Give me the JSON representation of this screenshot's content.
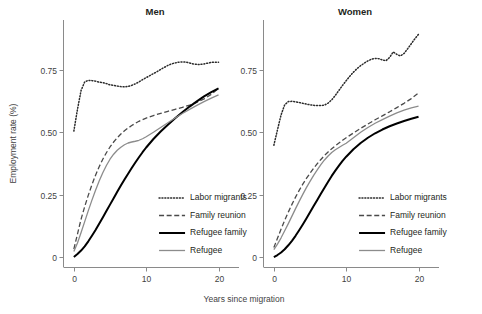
{
  "chart_data": {
    "type": "line",
    "title": "",
    "xlabel": "Years since migration",
    "ylabel": "Employment rate (%)",
    "xlim": [
      -1.5,
      22
    ],
    "ylim": [
      -0.04,
      0.95
    ],
    "xticks": [
      0,
      10,
      20
    ],
    "xtick_labels": [
      "0",
      "10",
      "20"
    ],
    "yticks": [
      0,
      0.25,
      0.5,
      0.75
    ],
    "ytick_labels": [
      "0",
      "0.25",
      "0.50",
      "0.75"
    ],
    "grid": false,
    "legend_position": "inside-bottom-right",
    "panels": [
      {
        "name": "men-panel",
        "title": "Men",
        "series": [
          {
            "name": "Labor migrants",
            "style": "dotted",
            "color": "#2b2b2b",
            "x": [
              0,
              0.5,
              1,
              1.5,
              2,
              2.5,
              3,
              3.5,
              4,
              4.5,
              5,
              5.5,
              6,
              6.5,
              7,
              7.5,
              8,
              8.5,
              9,
              9.5,
              10,
              10.5,
              11,
              11.5,
              12,
              12.5,
              13,
              13.5,
              14,
              14.5,
              15,
              15.5,
              16,
              16.5,
              17,
              17.5,
              18,
              18.5,
              19,
              19.5,
              20
            ],
            "y": [
              0.505,
              0.592,
              0.668,
              0.702,
              0.708,
              0.707,
              0.705,
              0.701,
              0.699,
              0.695,
              0.69,
              0.688,
              0.685,
              0.683,
              0.682,
              0.684,
              0.688,
              0.694,
              0.702,
              0.711,
              0.719,
              0.727,
              0.735,
              0.743,
              0.752,
              0.76,
              0.768,
              0.774,
              0.778,
              0.781,
              0.782,
              0.781,
              0.778,
              0.774,
              0.772,
              0.772,
              0.774,
              0.777,
              0.78,
              0.781,
              0.781
            ]
          },
          {
            "name": "Family reunion",
            "style": "dashed",
            "color": "#4a4a4a",
            "x": [
              0,
              0.5,
              1,
              1.5,
              2,
              2.5,
              3,
              3.5,
              4,
              4.5,
              5,
              5.5,
              6,
              6.5,
              7,
              7.5,
              8,
              8.5,
              9,
              9.5,
              10,
              11,
              12,
              13,
              14,
              15,
              16,
              17,
              18,
              19,
              20
            ],
            "y": [
              0.032,
              0.092,
              0.152,
              0.202,
              0.248,
              0.29,
              0.328,
              0.362,
              0.392,
              0.418,
              0.441,
              0.461,
              0.478,
              0.493,
              0.506,
              0.517,
              0.527,
              0.536,
              0.544,
              0.551,
              0.557,
              0.567,
              0.576,
              0.584,
              0.592,
              0.6,
              0.609,
              0.62,
              0.634,
              0.652,
              0.676
            ]
          },
          {
            "name": "Refugee family",
            "style": "solid-thick",
            "color": "#000000",
            "x": [
              0,
              0.5,
              1,
              1.5,
              2,
              2.5,
              3,
              3.5,
              4,
              4.5,
              5,
              5.5,
              6,
              6.5,
              7,
              7.5,
              8,
              8.5,
              9,
              9.5,
              10,
              11,
              12,
              13,
              14,
              15,
              16,
              17,
              18,
              19,
              20
            ],
            "y": [
              0.0,
              0.012,
              0.026,
              0.043,
              0.063,
              0.085,
              0.108,
              0.133,
              0.158,
              0.184,
              0.21,
              0.236,
              0.262,
              0.287,
              0.311,
              0.334,
              0.357,
              0.379,
              0.4,
              0.42,
              0.439,
              0.473,
              0.503,
              0.53,
              0.556,
              0.58,
              0.603,
              0.624,
              0.644,
              0.661,
              0.676
            ]
          },
          {
            "name": "Refugee",
            "style": "solid-gray",
            "color": "#8c8c8c",
            "x": [
              0,
              0.5,
              1,
              1.5,
              2,
              2.5,
              3,
              3.5,
              4,
              4.5,
              5,
              5.5,
              6,
              6.5,
              7,
              7.5,
              8,
              8.5,
              9,
              9.5,
              10,
              11,
              12,
              13,
              14,
              15,
              16,
              17,
              18,
              19,
              20
            ],
            "y": [
              0.022,
              0.056,
              0.098,
              0.142,
              0.186,
              0.228,
              0.268,
              0.305,
              0.338,
              0.367,
              0.392,
              0.412,
              0.428,
              0.44,
              0.45,
              0.457,
              0.461,
              0.464,
              0.468,
              0.474,
              0.482,
              0.5,
              0.519,
              0.538,
              0.557,
              0.575,
              0.592,
              0.608,
              0.623,
              0.637,
              0.65
            ]
          }
        ]
      },
      {
        "name": "women-panel",
        "title": "Women",
        "series": [
          {
            "name": "Labor migrants",
            "style": "dotted",
            "color": "#2b2b2b",
            "x": [
              0,
              0.5,
              1,
              1.5,
              2,
              2.5,
              3,
              3.5,
              4,
              4.5,
              5,
              5.5,
              6,
              6.5,
              7,
              7.5,
              8,
              8.5,
              9,
              9.5,
              10,
              10.5,
              11,
              11.5,
              12,
              12.5,
              13,
              13.5,
              14,
              14.5,
              15,
              15.5,
              16,
              16.5,
              17,
              17.5,
              18,
              18.5,
              19,
              19.5,
              20
            ],
            "y": [
              0.448,
              0.51,
              0.57,
              0.61,
              0.623,
              0.624,
              0.622,
              0.619,
              0.616,
              0.613,
              0.61,
              0.608,
              0.607,
              0.607,
              0.609,
              0.617,
              0.63,
              0.648,
              0.668,
              0.688,
              0.707,
              0.725,
              0.741,
              0.755,
              0.767,
              0.777,
              0.786,
              0.793,
              0.796,
              0.795,
              0.79,
              0.787,
              0.8,
              0.822,
              0.812,
              0.806,
              0.816,
              0.835,
              0.855,
              0.875,
              0.893
            ]
          },
          {
            "name": "Family reunion",
            "style": "dashed",
            "color": "#4a4a4a",
            "x": [
              0,
              0.5,
              1,
              1.5,
              2,
              2.5,
              3,
              3.5,
              4,
              4.5,
              5,
              5.5,
              6,
              6.5,
              7,
              7.5,
              8,
              8.5,
              9,
              9.5,
              10,
              11,
              12,
              13,
              14,
              15,
              16,
              17,
              18,
              19,
              20
            ],
            "y": [
              0.038,
              0.075,
              0.112,
              0.147,
              0.18,
              0.211,
              0.24,
              0.267,
              0.292,
              0.315,
              0.336,
              0.356,
              0.374,
              0.391,
              0.407,
              0.421,
              0.434,
              0.446,
              0.457,
              0.468,
              0.478,
              0.497,
              0.516,
              0.533,
              0.55,
              0.566,
              0.582,
              0.599,
              0.616,
              0.635,
              0.658
            ]
          },
          {
            "name": "Refugee family",
            "style": "solid-thick",
            "color": "#000000",
            "x": [
              0,
              0.5,
              1,
              1.5,
              2,
              2.5,
              3,
              3.5,
              4,
              4.5,
              5,
              5.5,
              6,
              6.5,
              7,
              7.5,
              8,
              8.5,
              9,
              9.5,
              10,
              11,
              12,
              13,
              14,
              15,
              16,
              17,
              18,
              19,
              20
            ],
            "y": [
              0.0,
              0.008,
              0.018,
              0.031,
              0.047,
              0.065,
              0.085,
              0.107,
              0.13,
              0.154,
              0.179,
              0.204,
              0.229,
              0.254,
              0.278,
              0.302,
              0.325,
              0.346,
              0.366,
              0.385,
              0.402,
              0.432,
              0.457,
              0.478,
              0.496,
              0.511,
              0.524,
              0.535,
              0.545,
              0.554,
              0.562
            ]
          },
          {
            "name": "Refugee",
            "style": "solid-gray",
            "color": "#8c8c8c",
            "x": [
              0,
              0.5,
              1,
              1.5,
              2,
              2.5,
              3,
              3.5,
              4,
              4.5,
              5,
              5.5,
              6,
              6.5,
              7,
              7.5,
              8,
              8.5,
              9,
              9.5,
              10,
              11,
              12,
              13,
              14,
              15,
              16,
              17,
              18,
              19,
              20
            ],
            "y": [
              0.03,
              0.052,
              0.077,
              0.105,
              0.134,
              0.164,
              0.194,
              0.223,
              0.251,
              0.278,
              0.303,
              0.327,
              0.349,
              0.37,
              0.389,
              0.405,
              0.419,
              0.43,
              0.439,
              0.448,
              0.456,
              0.478,
              0.5,
              0.519,
              0.536,
              0.551,
              0.565,
              0.578,
              0.589,
              0.598,
              0.605
            ]
          }
        ]
      }
    ],
    "legend": [
      {
        "label": "Labor migrants",
        "style": "dotted",
        "color": "#2b2b2b"
      },
      {
        "label": "Family reunion",
        "style": "dashed",
        "color": "#4a4a4a"
      },
      {
        "label": "Refugee family",
        "style": "solid-thick",
        "color": "#000000"
      },
      {
        "label": "Refugee",
        "style": "solid-gray",
        "color": "#8c8c8c"
      }
    ]
  }
}
